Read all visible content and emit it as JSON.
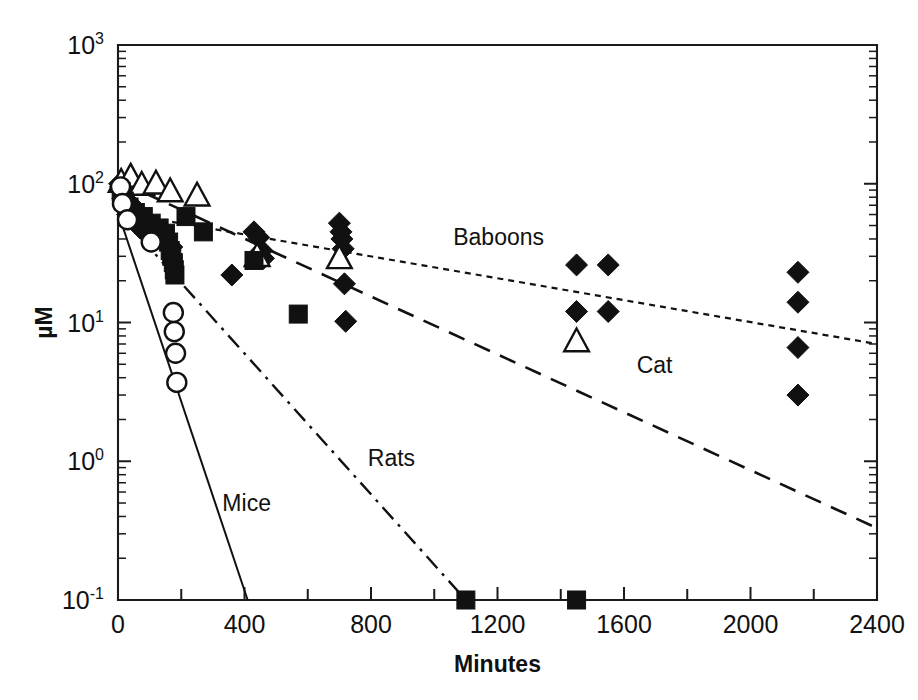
{
  "chart_data": {
    "type": "scatter",
    "title": "",
    "xlabel": "Minutes",
    "ylabel": "µM",
    "xlim": [
      0,
      2400
    ],
    "ylim": [
      0.1,
      1000
    ],
    "yscale": "log",
    "xscale": "linear",
    "grid": false,
    "legend_position": "inline-annotations",
    "xticks": [
      0,
      200,
      400,
      600,
      800,
      1000,
      1200,
      1400,
      1600,
      1800,
      2000,
      2200,
      2400
    ],
    "xtick_labels": [
      "0",
      "",
      "400",
      "",
      "800",
      "",
      "1200",
      "",
      "1600",
      "",
      "2000",
      "",
      "2400"
    ],
    "ytick_labels": [
      "10³",
      "10²",
      "10¹",
      "10⁰",
      "10⁻¹"
    ],
    "yticks": [
      1000,
      100,
      10,
      1,
      0.1
    ],
    "ytick_mantissa": [
      "10",
      "10",
      "10",
      "10",
      "10"
    ],
    "ytick_exponent": [
      "3",
      "2",
      "1",
      "0",
      "-1"
    ],
    "annotations": [
      {
        "text": "Baboons",
        "x": 1060,
        "y": 36.0
      },
      {
        "text": "Cat",
        "x": 1640,
        "y": 4.3
      },
      {
        "text": "Rats",
        "x": 790,
        "y": 0.93
      },
      {
        "text": "Mice",
        "x": 330,
        "y": 0.44
      }
    ],
    "series": [
      {
        "name": "Baboons",
        "marker": "filled-diamond",
        "line_style": "dotted",
        "fit_line": {
          "x": [
            0,
            2400
          ],
          "y": [
            62.0,
            7.0
          ]
        },
        "points": [
          {
            "x": 5,
            "y": 100
          },
          {
            "x": 8,
            "y": 95
          },
          {
            "x": 12,
            "y": 88
          },
          {
            "x": 15,
            "y": 78
          },
          {
            "x": 20,
            "y": 72
          },
          {
            "x": 25,
            "y": 66
          },
          {
            "x": 30,
            "y": 60
          },
          {
            "x": 35,
            "y": 58
          },
          {
            "x": 45,
            "y": 70
          },
          {
            "x": 55,
            "y": 64
          },
          {
            "x": 60,
            "y": 52
          },
          {
            "x": 70,
            "y": 48
          },
          {
            "x": 90,
            "y": 55
          },
          {
            "x": 110,
            "y": 46
          },
          {
            "x": 130,
            "y": 42
          },
          {
            "x": 150,
            "y": 38
          },
          {
            "x": 170,
            "y": 35
          },
          {
            "x": 360,
            "y": 22
          },
          {
            "x": 430,
            "y": 45
          },
          {
            "x": 445,
            "y": 41
          },
          {
            "x": 455,
            "y": 33
          },
          {
            "x": 460,
            "y": 29
          },
          {
            "x": 700,
            "y": 52
          },
          {
            "x": 705,
            "y": 45
          },
          {
            "x": 708,
            "y": 40
          },
          {
            "x": 712,
            "y": 34
          },
          {
            "x": 716,
            "y": 19
          },
          {
            "x": 720,
            "y": 10.2
          },
          {
            "x": 1450,
            "y": 26
          },
          {
            "x": 1450,
            "y": 12
          },
          {
            "x": 1550,
            "y": 26
          },
          {
            "x": 1550,
            "y": 12
          },
          {
            "x": 2150,
            "y": 23
          },
          {
            "x": 2150,
            "y": 14
          },
          {
            "x": 2150,
            "y": 6.6
          },
          {
            "x": 2150,
            "y": 3.0
          }
        ]
      },
      {
        "name": "Cat",
        "marker": "open-triangle",
        "line_style": "dashed",
        "fit_line": {
          "x": [
            0,
            2400
          ],
          "y": [
            105.0,
            0.33
          ]
        },
        "points": [
          {
            "x": 10,
            "y": 103
          },
          {
            "x": 40,
            "y": 112
          },
          {
            "x": 75,
            "y": 98
          },
          {
            "x": 120,
            "y": 100
          },
          {
            "x": 165,
            "y": 88
          },
          {
            "x": 250,
            "y": 82
          },
          {
            "x": 440,
            "y": 30
          },
          {
            "x": 700,
            "y": 29
          },
          {
            "x": 1450,
            "y": 7.3
          }
        ]
      },
      {
        "name": "Rats",
        "marker": "filled-square",
        "line_style": "dash-dot",
        "fit_line": {
          "x": [
            0,
            1100
          ],
          "y": [
            62.0,
            0.1
          ]
        },
        "points": [
          {
            "x": 10,
            "y": 88
          },
          {
            "x": 20,
            "y": 75
          },
          {
            "x": 35,
            "y": 68
          },
          {
            "x": 55,
            "y": 62
          },
          {
            "x": 80,
            "y": 58
          },
          {
            "x": 105,
            "y": 52
          },
          {
            "x": 130,
            "y": 48
          },
          {
            "x": 150,
            "y": 44
          },
          {
            "x": 160,
            "y": 38
          },
          {
            "x": 165,
            "y": 33
          },
          {
            "x": 170,
            "y": 30
          },
          {
            "x": 175,
            "y": 27
          },
          {
            "x": 178,
            "y": 24
          },
          {
            "x": 180,
            "y": 22
          },
          {
            "x": 215,
            "y": 58
          },
          {
            "x": 270,
            "y": 45
          },
          {
            "x": 430,
            "y": 28
          },
          {
            "x": 570,
            "y": 11.5
          },
          {
            "x": 1100,
            "y": 0.1
          },
          {
            "x": 1450,
            "y": 0.1
          }
        ]
      },
      {
        "name": "Mice",
        "marker": "open-circle",
        "line_style": "solid",
        "fit_line": {
          "x": [
            0,
            410
          ],
          "y": [
            62.0,
            0.1
          ]
        },
        "points": [
          {
            "x": 8,
            "y": 95
          },
          {
            "x": 14,
            "y": 72
          },
          {
            "x": 30,
            "y": 55
          },
          {
            "x": 105,
            "y": 38
          },
          {
            "x": 175,
            "y": 11.8
          },
          {
            "x": 178,
            "y": 8.6
          },
          {
            "x": 182,
            "y": 6.0
          },
          {
            "x": 186,
            "y": 3.7
          }
        ]
      }
    ]
  },
  "figure": {
    "plot_left_px": 118,
    "plot_right_px": 877,
    "plot_top_px": 45,
    "plot_bottom_px": 600
  }
}
